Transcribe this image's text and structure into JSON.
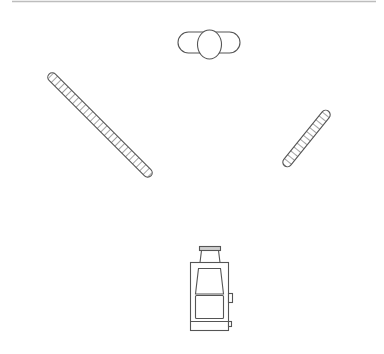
{
  "diagram": {
    "type": "line-drawing",
    "colors": {
      "background": "#ffffff",
      "stroke": "#555555",
      "top_rule": "#bdbdbd",
      "hatch": "#555555"
    },
    "elements": [
      {
        "id": "top-rule",
        "label": "Top border line"
      },
      {
        "id": "top-fixture",
        "label": "Oval capsule with central ellipse"
      },
      {
        "id": "left-bar",
        "label": "Left hatched diagonal bar"
      },
      {
        "id": "right-bar",
        "label": "Right hatched diagonal bar"
      },
      {
        "id": "stove",
        "label": "Stove with chimney, door, and side knobs"
      }
    ]
  }
}
